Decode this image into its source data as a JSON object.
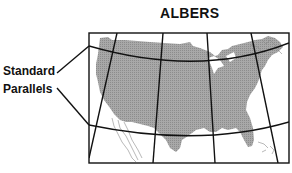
{
  "title": "ALBERS",
  "labels": {
    "line1": "Standard",
    "line2": "Parallels"
  },
  "colors": {
    "land": "#9c9c9c",
    "lines": "#111111",
    "coast": "#8a8a8a",
    "background": "#ffffff"
  },
  "map": {
    "projection": "Albers equal-area conic",
    "region": "Conterminous United States",
    "standard_parallels_count": 2
  }
}
